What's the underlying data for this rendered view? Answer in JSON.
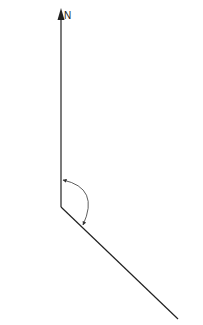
{
  "diagram": {
    "north_label": "N",
    "stroke_color": "#222222",
    "arc_color": "#333333",
    "background": "#ffffff",
    "vertex": {
      "x": 61,
      "y": 207
    },
    "north_tip": {
      "x": 61,
      "y": 10
    },
    "bearing_end": {
      "x": 178,
      "y": 319
    },
    "angle_arc": {
      "start": {
        "x": 62,
        "y": 180
      },
      "control": {
        "x": 98,
        "y": 190
      },
      "end": {
        "x": 82,
        "y": 226
      },
      "direction": "clockwise"
    }
  }
}
